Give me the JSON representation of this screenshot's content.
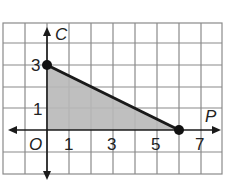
{
  "diagram": {
    "type": "coordinate-graph",
    "x_axis_label": "P",
    "y_axis_label": "C",
    "origin_label": "O",
    "x_tick_labels": [
      "1",
      "3",
      "5",
      "7"
    ],
    "y_tick_labels": [
      "1",
      "3"
    ],
    "points": [
      {
        "name": "y-intercept",
        "x": 0,
        "y": 3
      },
      {
        "name": "x-intercept",
        "x": 6,
        "y": 0
      }
    ],
    "shaded_region": "triangle with vertices (0,0), (0,3), (6,0)",
    "colors": {
      "grid": "#8a8a8a",
      "axis": "#1a1a1a",
      "line": "#1a1a1a",
      "shade": "#b8b8b8"
    }
  }
}
